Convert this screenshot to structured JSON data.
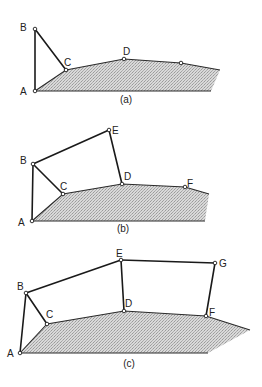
{
  "figure": {
    "panels": [
      {
        "id": "a",
        "caption": "(a)",
        "caption_pos": [
          126,
          103
        ],
        "ground": [
          [
            35,
            91
          ],
          [
            66,
            70
          ],
          [
            124,
            59
          ],
          [
            181,
            63
          ],
          [
            220,
            70
          ],
          [
            211,
            91
          ]
        ],
        "links": [
          [
            [
              35,
              91
            ],
            [
              35,
              29
            ]
          ],
          [
            [
              35,
              29
            ],
            [
              66,
              70
            ]
          ]
        ],
        "joints": [
          {
            "name": "A",
            "pos": [
              35,
              91
            ],
            "label": "A",
            "label_pos": [
              20,
              95
            ]
          },
          {
            "name": "B",
            "pos": [
              35,
              29
            ],
            "label": "B",
            "label_pos": [
              20,
              31
            ]
          },
          {
            "name": "C",
            "pos": [
              66,
              70
            ],
            "label": "C",
            "label_pos": [
              64,
              66
            ]
          },
          {
            "name": "D",
            "pos": [
              124,
              59
            ],
            "label": "D",
            "label_pos": [
              123,
              55
            ]
          },
          {
            "name": "P",
            "pos": [
              181,
              63
            ],
            "label": "",
            "label_pos": [
              0,
              0
            ]
          }
        ]
      },
      {
        "id": "b",
        "caption": "(b)",
        "caption_pos": [
          123,
          232
        ],
        "ground": [
          [
            32,
            221
          ],
          [
            63,
            194
          ],
          [
            122,
            184
          ],
          [
            185,
            187
          ],
          [
            209,
            194
          ],
          [
            205,
            221
          ]
        ],
        "links": [
          [
            [
              32,
              221
            ],
            [
              33,
              164
            ]
          ],
          [
            [
              33,
              164
            ],
            [
              63,
              194
            ]
          ],
          [
            [
              33,
              164
            ],
            [
              109,
              130
            ]
          ],
          [
            [
              109,
              130
            ],
            [
              122,
              184
            ]
          ]
        ],
        "joints": [
          {
            "name": "A",
            "pos": [
              32,
              221
            ],
            "label": "A",
            "label_pos": [
              18,
              226
            ]
          },
          {
            "name": "B",
            "pos": [
              33,
              164
            ],
            "label": "B",
            "label_pos": [
              20,
              164
            ]
          },
          {
            "name": "C",
            "pos": [
              63,
              194
            ],
            "label": "C",
            "label_pos": [
              60,
              190
            ]
          },
          {
            "name": "D",
            "pos": [
              122,
              184
            ],
            "label": "D",
            "label_pos": [
              124,
              180
            ]
          },
          {
            "name": "E",
            "pos": [
              109,
              130
            ],
            "label": "E",
            "label_pos": [
              112,
              134
            ]
          },
          {
            "name": "F",
            "pos": [
              185,
              187
            ],
            "label": "F",
            "label_pos": [
              187,
              187
            ]
          }
        ]
      },
      {
        "id": "c",
        "caption": "(c)",
        "caption_pos": [
          129,
          367
        ],
        "ground": [
          [
            20,
            353
          ],
          [
            47,
            324
          ],
          [
            124,
            311
          ],
          [
            206,
            316
          ],
          [
            250,
            330
          ],
          [
            208,
            353
          ]
        ],
        "links": [
          [
            [
              20,
              353
            ],
            [
              26,
              293
            ]
          ],
          [
            [
              26,
              293
            ],
            [
              47,
              324
            ]
          ],
          [
            [
              26,
              293
            ],
            [
              121,
              260
            ]
          ],
          [
            [
              121,
              260
            ],
            [
              124,
              311
            ]
          ],
          [
            [
              121,
              260
            ],
            [
              215,
              263
            ]
          ],
          [
            [
              215,
              263
            ],
            [
              206,
              316
            ]
          ]
        ],
        "joints": [
          {
            "name": "A",
            "pos": [
              20,
              353
            ],
            "label": "A",
            "label_pos": [
              7,
              357
            ]
          },
          {
            "name": "B",
            "pos": [
              26,
              293
            ],
            "label": "B",
            "label_pos": [
              17,
              290
            ]
          },
          {
            "name": "C",
            "pos": [
              47,
              324
            ],
            "label": "C",
            "label_pos": [
              46,
              318
            ]
          },
          {
            "name": "D",
            "pos": [
              124,
              311
            ],
            "label": "D",
            "label_pos": [
              125,
              307
            ]
          },
          {
            "name": "E",
            "pos": [
              121,
              260
            ],
            "label": "E",
            "label_pos": [
              116,
              257
            ]
          },
          {
            "name": "F",
            "pos": [
              206,
              316
            ],
            "label": "F",
            "label_pos": [
              209,
              316
            ]
          },
          {
            "name": "G",
            "pos": [
              215,
              263
            ],
            "label": "G",
            "label_pos": [
              219,
              267
            ]
          }
        ]
      }
    ]
  }
}
